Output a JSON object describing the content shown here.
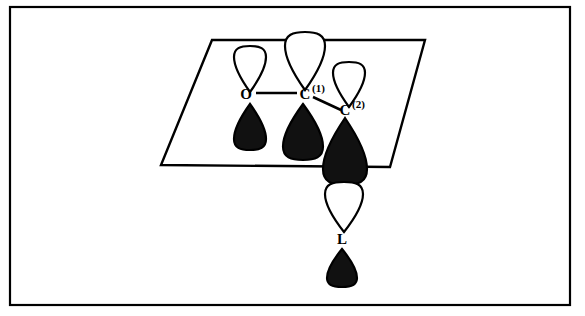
{
  "figure": {
    "background_color": "#ffffff",
    "line_color": "#000000",
    "filled_lobe_color": "#111111",
    "empty_lobe_color": "#ffffff"
  },
  "frame": {
    "name": "outer-border",
    "x": 10,
    "y": 7,
    "width": 560,
    "height": 298,
    "stroke_width": 2.2
  },
  "plane": {
    "name": "molecular-plane",
    "points": "212,40 425,40 390,167 161,165",
    "stroke_width": 2.4
  },
  "labels": {
    "oxygen": {
      "text": "O",
      "sup": "",
      "x": 246,
      "y": 99
    },
    "carbon1": {
      "text": "C",
      "sup": "(1)",
      "x": 305,
      "y": 99
    },
    "carbon2": {
      "text": "C",
      "sup": "(2)",
      "x": 345,
      "y": 115
    },
    "ligand": {
      "text": "L",
      "sup": "",
      "x": 342,
      "y": 244
    }
  },
  "bonds": [
    {
      "name": "bond-o-c1",
      "x1": 256,
      "y1": 93,
      "x2": 297,
      "y2": 93,
      "width": 2.6
    },
    {
      "name": "bond-c1-c2",
      "x1": 313,
      "y1": 97,
      "x2": 341,
      "y2": 110,
      "width": 2.6
    }
  ],
  "orbitals": [
    {
      "name": "orbital-o-upper",
      "atom": "O",
      "fill": "empty",
      "cx": 250,
      "tip_y": 92,
      "bulb_y": 46,
      "half_width": 16,
      "direction": "down",
      "stroke_width": 2.2
    },
    {
      "name": "orbital-o-lower",
      "atom": "O",
      "fill": "filled",
      "cx": 250,
      "tip_y": 104,
      "bulb_y": 150,
      "half_width": 16,
      "direction": "up",
      "stroke_width": 2.2
    },
    {
      "name": "orbital-c1-upper",
      "atom": "C(1)",
      "fill": "empty",
      "cx": 305,
      "tip_y": 90,
      "bulb_y": 32,
      "half_width": 20,
      "direction": "down",
      "stroke_width": 2.2
    },
    {
      "name": "orbital-c1-lower",
      "atom": "C(1)",
      "fill": "filled",
      "cx": 303,
      "tip_y": 104,
      "bulb_y": 160,
      "half_width": 20,
      "direction": "up",
      "stroke_width": 2.2
    },
    {
      "name": "orbital-c2-upper",
      "atom": "C(2)",
      "fill": "empty",
      "cx": 349,
      "tip_y": 107,
      "bulb_y": 62,
      "half_width": 16,
      "direction": "down",
      "stroke_width": 2.2
    },
    {
      "name": "orbital-c2-lower",
      "atom": "C(2)",
      "fill": "filled",
      "cx": 345,
      "tip_y": 118,
      "bulb_y": 185,
      "half_width": 22,
      "direction": "up",
      "stroke_width": 2.2
    },
    {
      "name": "orbital-l-upper",
      "atom": "L",
      "fill": "empty",
      "cx": 344,
      "tip_y": 232,
      "bulb_y": 182,
      "half_width": 19,
      "direction": "down",
      "stroke_width": 2.2
    },
    {
      "name": "orbital-l-lower",
      "atom": "L",
      "fill": "filled",
      "cx": 342,
      "tip_y": 249,
      "bulb_y": 287,
      "half_width": 15,
      "direction": "up",
      "stroke_width": 2.2
    }
  ]
}
